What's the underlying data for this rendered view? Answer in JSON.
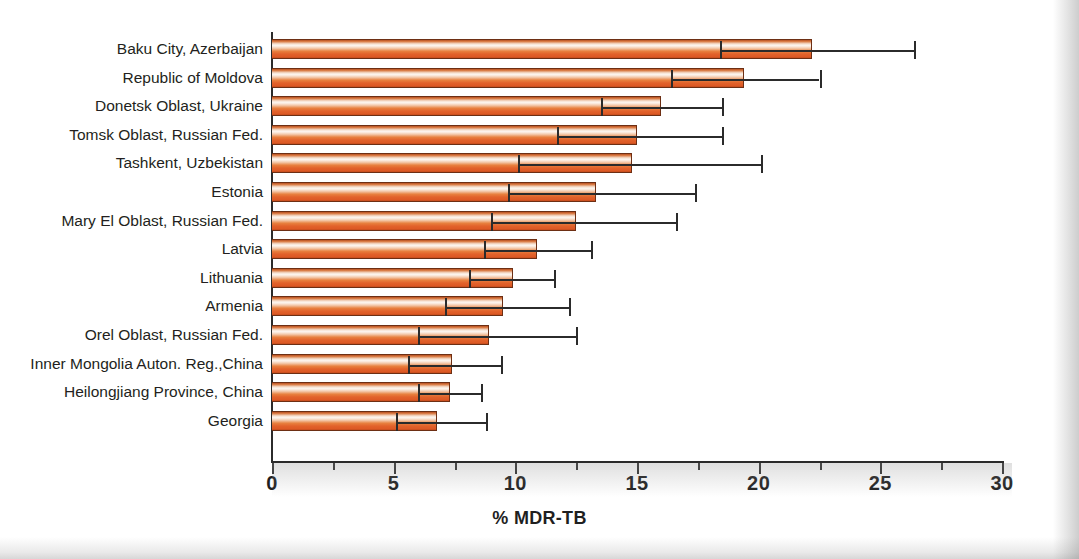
{
  "chart_data": {
    "type": "bar",
    "orientation": "horizontal",
    "title": "",
    "xlabel": "% MDR-TB",
    "ylabel": "",
    "xlim": [
      0,
      30
    ],
    "xticks": [
      0,
      5,
      10,
      15,
      20,
      25,
      30
    ],
    "xtick_labels": [
      "0",
      "5",
      "10",
      "15",
      "20",
      "25",
      "30"
    ],
    "minor_tick_step": 2.5,
    "grid": false,
    "legend": false,
    "error_bars": "95% confidence interval",
    "categories": [
      "Baku City, Azerbaijan",
      "Republic of Moldova",
      "Donetsk Oblast, Ukraine",
      "Tomsk Oblast, Russian Fed.",
      "Tashkent, Uzbekistan",
      "Estonia",
      "Mary El Oblast, Russian Fed.",
      "Latvia",
      "Lithuania",
      "Armenia",
      "Orel Oblast, Russian Fed.",
      "Inner Mongolia Auton. Reg.,China",
      "Heilongjiang Province, China",
      "Georgia"
    ],
    "values": [
      22.2,
      19.4,
      16.0,
      15.0,
      14.8,
      13.3,
      12.5,
      10.9,
      9.9,
      9.5,
      8.9,
      7.4,
      7.3,
      6.8
    ],
    "ci_low": [
      18.4,
      16.4,
      13.5,
      11.7,
      10.1,
      9.7,
      9.0,
      8.7,
      8.1,
      7.1,
      6.0,
      5.6,
      6.0,
      5.1
    ],
    "ci_high": [
      26.4,
      22.5,
      18.5,
      18.5,
      20.1,
      17.4,
      16.6,
      13.1,
      11.6,
      12.2,
      12.5,
      9.4,
      8.6,
      8.8
    ]
  },
  "style": {
    "bar_fill_light": "#fdf6f0",
    "bar_fill_mid": "#e8813f",
    "bar_fill_dark": "#c44c1d",
    "bar_outline": "#6d2f14",
    "axis_color": "#2b2b2b",
    "text_color": "#231f20",
    "background": "#ffffff"
  }
}
